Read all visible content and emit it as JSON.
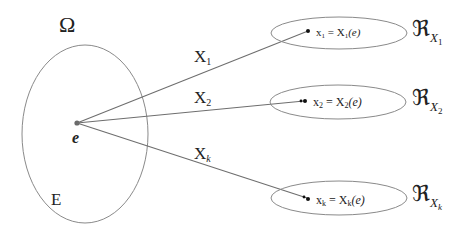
{
  "diagram": {
    "sample_space": {
      "symbol": "Ω",
      "event_label": "E",
      "outcome_label": "e"
    },
    "mappings": [
      {
        "function_label": "X",
        "function_subscript": "1",
        "value_expression": {
          "lhs": "x",
          "lhs_sub": "1",
          "eq": " = ",
          "rhs": "X",
          "rhs_sub": "1",
          "arg": "(e)"
        },
        "range_symbol": "ℜ",
        "range_subscript_main": "X",
        "range_subscript_sub": "1"
      },
      {
        "function_label": "X",
        "function_subscript": "2",
        "value_expression": {
          "lhs": "x",
          "lhs_sub": "2",
          "eq": " = ",
          "rhs": "X",
          "rhs_sub": "2",
          "arg": "(e)"
        },
        "range_symbol": "ℜ",
        "range_subscript_main": "X",
        "range_subscript_sub": "2"
      },
      {
        "function_label": "X",
        "function_subscript": "k",
        "value_expression": {
          "lhs": "x",
          "lhs_sub": "k",
          "eq": " = ",
          "rhs": "X",
          "rhs_sub": "k",
          "arg": "(e)"
        },
        "range_symbol": "ℜ",
        "range_subscript_main": "X",
        "range_subscript_sub": "k"
      }
    ],
    "colors": {
      "outline": "#8a8a8a",
      "line": "#6e6e6e",
      "text": "#222222",
      "background": "#ffffff"
    }
  }
}
